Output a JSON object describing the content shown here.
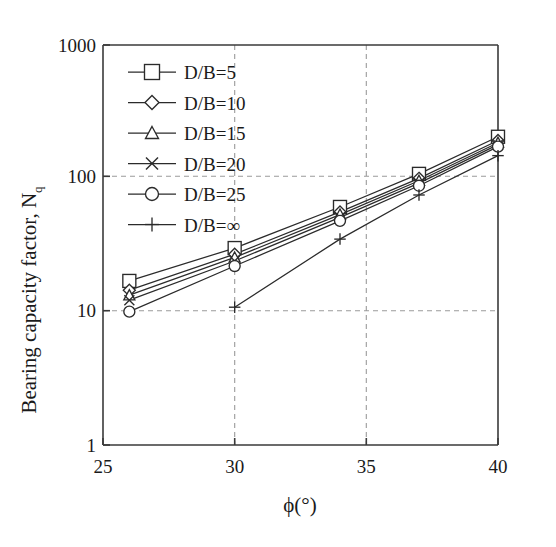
{
  "chart_data": {
    "type": "line",
    "title": "",
    "xlabel": "ϕ(°)",
    "ylabel": "Bearing capacity factor, N",
    "ylabel_sub": "q",
    "xlim": [
      25,
      40
    ],
    "ylim": [
      1,
      1000
    ],
    "yscale": "log",
    "xscale": "linear",
    "grid": true,
    "gridlines_x": [
      30,
      35
    ],
    "gridlines_y": [
      10,
      100
    ],
    "xticks": [
      25,
      30,
      35,
      40
    ],
    "xtick_labels": [
      "25",
      "30",
      "35",
      "40"
    ],
    "yticks": [
      1,
      10,
      100,
      1000
    ],
    "ytick_labels": [
      "1",
      "10",
      "100",
      "1000"
    ],
    "x": [
      26,
      30,
      34,
      37,
      40
    ],
    "legend_position": "upper-left",
    "series": [
      {
        "name": "D/B=5",
        "label": "D/B=5",
        "marker": "square",
        "values": [
          17.0,
          30.0,
          61.0,
          108.0,
          205.0
        ]
      },
      {
        "name": "D/B=10",
        "label": "D/B=10",
        "marker": "diamond",
        "values": [
          14.5,
          27.0,
          56.0,
          100.0,
          192.0
        ]
      },
      {
        "name": "D/B=15",
        "label": "D/B=15",
        "marker": "triangle",
        "values": [
          13.3,
          25.5,
          53.5,
          96.0,
          185.0
        ]
      },
      {
        "name": "D/B=20",
        "label": "D/B=20",
        "marker": "cross",
        "values": [
          12.2,
          24.0,
          51.0,
          92.0,
          179.0
        ]
      },
      {
        "name": "D/B=25",
        "label": "D/B=25",
        "marker": "circle",
        "values": [
          10.0,
          22.0,
          48.0,
          88.0,
          173.0
        ]
      },
      {
        "name": "D/B=∞",
        "label": "D/B=∞",
        "marker": "plus",
        "values": [
          null,
          10.8,
          35.0,
          75.0,
          148.0
        ]
      }
    ]
  },
  "legend": {
    "items": [
      {
        "label": "D/B=5",
        "marker": "square-marker"
      },
      {
        "label": "D/B=10",
        "marker": "diamond-marker"
      },
      {
        "label": "D/B=15",
        "marker": "triangle-marker"
      },
      {
        "label": "D/B=20",
        "marker": "cross-marker"
      },
      {
        "label": "D/B=25",
        "marker": "circle-marker"
      },
      {
        "label": "D/B=∞",
        "marker": "plus-marker"
      }
    ]
  },
  "axes": {
    "y_title_main": "Bearing capacity factor, N",
    "y_title_sub": "q",
    "x_title_symbol": "ϕ",
    "x_title_unit": "(°)",
    "y_tick_1000": "1000",
    "y_tick_100": "100",
    "y_tick_10": "10",
    "y_tick_1": "1",
    "x_tick_25": "25",
    "x_tick_30": "30",
    "x_tick_35": "35",
    "x_tick_40": "40"
  },
  "colors": {
    "line": "#2b2b2b",
    "axis": "#3a3a3a",
    "grid": "#9a9a9a",
    "background": "#ffffff"
  }
}
